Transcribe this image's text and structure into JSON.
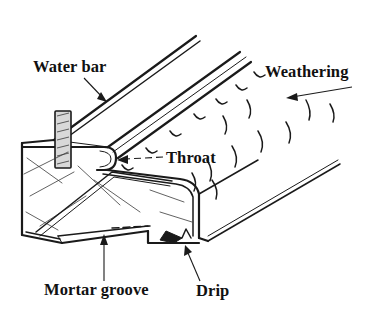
{
  "figure": {
    "background_color": "#ffffff",
    "ink_color": "#1a1a1a",
    "water_bar_fill": "#d8d8d8",
    "style": "hand-drawn technical line illustration, axonometric"
  },
  "labels": {
    "water_bar": "Water bar",
    "weathering": "Weathering",
    "throat": "Throat",
    "mortar_groove": "Mortar groove",
    "drip": "Drip"
  },
  "annotations": [
    {
      "id": "water-bar",
      "text": "Water bar",
      "text_x": 33,
      "text_y": 72,
      "leader": "M 84 78 L 106 101",
      "arrow_at": [
        106,
        101
      ],
      "arrow_angle": 46,
      "points_to": "hatched vertical bar set into the sloping top"
    },
    {
      "id": "weathering",
      "text": "Weathering",
      "text_x": 265,
      "text_y": 77,
      "leader": "M 350 88 L 288 98",
      "arrow_at": [
        288,
        98
      ],
      "arrow_angle": 189,
      "points_to": "sloped upper face shedding water"
    },
    {
      "id": "throat",
      "text": "Throat",
      "text_x": 166,
      "text_y": 163,
      "leader": "M 162 158 L 118 160",
      "arrow_at": [
        118,
        160
      ],
      "arrow_angle": 182,
      "points_to": "rounded rebate groove under the sill nose"
    },
    {
      "id": "mortar-groove",
      "text": "Mortar groove",
      "text_x": 44,
      "text_y": 295,
      "leader": "M 104 279 L 104 239",
      "arrow_at": [
        104,
        239
      ],
      "arrow_angle": 270,
      "points_to": "recess on the underside bedding face"
    },
    {
      "id": "drip",
      "text": "Drip",
      "text_x": 196,
      "text_y": 296,
      "leader": "M 199 279 L 186 247",
      "arrow_at": [
        186,
        247
      ],
      "arrow_angle": 248,
      "points_to": "V-notch at the lower outer arris"
    }
  ],
  "geometry": {
    "top_slope_lines": 5,
    "weathering_tick_count": 7,
    "rain_stroke_count": 10,
    "crack_line_count": 9,
    "vanishing_direction": "upper-right"
  }
}
